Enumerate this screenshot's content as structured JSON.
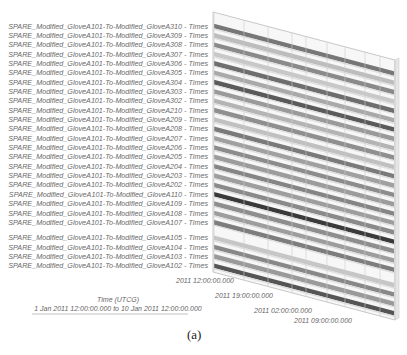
{
  "chart_data": {
    "type": "bar",
    "subtype": "3d-timeline",
    "title": "",
    "xlabel": "Time (UTCG)",
    "xrange_label": "1 Jan 2011 12:00:00.000  to  10 Jan 2011 12:00:00.000",
    "xlim": [
      "1 Jan 2011 12:00:00.000",
      "10 Jan 2011 12:00:00.000"
    ],
    "x_ticks": [
      "2011 12:00:00.000",
      "2011 19:00:00.000",
      "2011 02:00:00.000",
      "2011 09:00:00.000"
    ],
    "grid": true,
    "legend": "none",
    "caption": "(a)",
    "categories": [
      "SPARE_Modified_GloveA101-To-Modified_GloveA310 - Times",
      "SPARE_Modified_GloveA101-To-Modified_GloveA309 - Times",
      "SPARE_Modified_GloveA101-To-Modified_GloveA308 - Times",
      "SPARE_Modified_GloveA101-To-Modified_GloveA307 - Times",
      "SPARE_Modified_GloveA101-To-Modified_GloveA306 - Times",
      "SPARE_Modified_GloveA101-To-Modified_GloveA305 - Times",
      "SPARE_Modified_GloveA101-To-Modified_GloveA304 - Times",
      "SPARE_Modified_GloveA101-To-Modified_GloveA303 - Times",
      "SPARE_Modified_GloveA101-To-Modified_GloveA302 - Times",
      "SPARE_Modified_GloveA101-To-Modified_GloveA210 - Times",
      "SPARE_Modified_GloveA101-To-Modified_GloveA209 - Times",
      "SPARE_Modified_GloveA101-To-Modified_GloveA208 - Times",
      "SPARE_Modified_GloveA101-To-Modified_GloveA207 - Times",
      "SPARE_Modified_GloveA101-To-Modified_GloveA206 - Times",
      "SPARE_Modified_GloveA101-To-Modified_GloveA205 - Times",
      "SPARE_Modified_GloveA101-To-Modified_GloveA204 - Times",
      "SPARE_Modified_GloveA101-To-Modified_GloveA203 - Times",
      "SPARE_Modified_GloveA101-To-Modified_GloveA202 - Times",
      "SPARE_Modified_GloveA101-To-Modified_GloveA110 - Times",
      "SPARE_Modified_GloveA101-To-Modified_GloveA109 - Times",
      "SPARE_Modified_GloveA101-To-Modified_GloveA108 - Times",
      "SPARE_Modified_GloveA101-To-Modified_GloveA107 - Times",
      "SPARE_Modified_GloveA101-To-Modified_GloveA105 - Times",
      "SPARE_Modified_GloveA101-To-Modified_GloveA104 - Times",
      "SPARE_Modified_GloveA101-To-Modified_GloveA103 - Times",
      "SPARE_Modified_GloveA101-To-Modified_GloveA102 - Times"
    ],
    "bar_shades": [
      "#777777",
      "#bdbdbd",
      "#8a8a8a",
      "#c8c8c8",
      "#6e6e6e",
      "#a9a9a9",
      "#5a5a5a",
      "#9a9a9a",
      "#b4b4b4",
      "#8f8f8f",
      "#c0c0c0",
      "#7a7a7a",
      "#a0a0a0",
      "#8c8c8c",
      "#9c9c9c",
      "#858585",
      "#9e9e9e",
      "#8a8a8a",
      "#3a3a3a",
      "#8e8e8e",
      "#9d9d9d",
      "#7d7d7d",
      "#c6c6c6",
      "#888888",
      "#9a9a9a",
      "#555555"
    ],
    "gap_after_index": 21
  },
  "labels": {
    "axis_title": "Time (UTCG)",
    "axis_range": "1 Jan 2011 12:00:00.000  to  10 Jan 2011 12:00:00.000",
    "caption": "(a)"
  }
}
